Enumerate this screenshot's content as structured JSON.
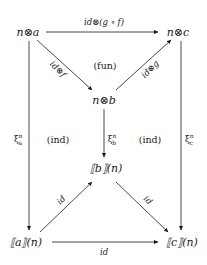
{
  "diagram": {
    "nodes": {
      "n_a": "n⊗a",
      "n_c": "n⊗c",
      "n_b": "n⊗b",
      "sem_b": "⟦b⟧(n)",
      "sem_a": "⟦a⟧(n)",
      "sem_c": "⟦c⟧(n)"
    },
    "edges": {
      "top": "id⊗(g ∘ f)",
      "na_to_nb": "id⊗f",
      "nb_to_nc": "id⊗g",
      "xi_a": "ξ",
      "xi_a_sub": "a",
      "xi_a_sup": "n",
      "xi_b": "ξ",
      "xi_b_sub": "b",
      "xi_b_sup": "n",
      "xi_c": "ξ",
      "xi_c_sub": "c",
      "xi_c_sup": "n",
      "semA_to_semB": "id",
      "semB_to_semC": "id",
      "bottom": "id"
    },
    "cells": {
      "fun": "(fun)",
      "ind_left": "(ind)",
      "ind_right": "(ind)"
    },
    "colors": {
      "stroke": "#1a1a1a",
      "background": "#ffffff"
    }
  }
}
